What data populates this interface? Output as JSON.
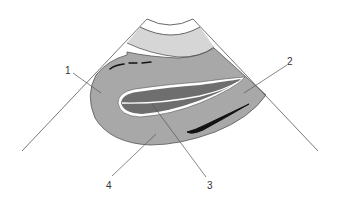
{
  "diagram": {
    "type": "ultrasound-sector-schematic",
    "colors": {
      "background": "#ffffff",
      "near_field_band": "#ffffff",
      "second_band": "#d6d6d6",
      "organ": "#a8a8a8",
      "inner_structure": "#6e6e6e",
      "inner_outline": "#ffffff",
      "outline": "#555555",
      "echo_streak": "#111111",
      "leader_line": "#555555",
      "label_text": "#333333"
    },
    "labels": [
      {
        "id": "1",
        "text": "1"
      },
      {
        "id": "2",
        "text": "2"
      },
      {
        "id": "3",
        "text": "3"
      },
      {
        "id": "4",
        "text": "4"
      }
    ]
  }
}
